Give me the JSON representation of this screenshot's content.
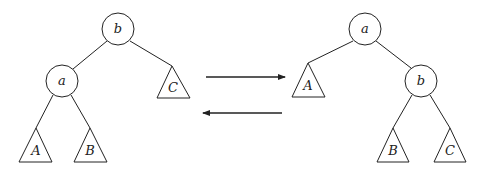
{
  "diagram": {
    "left_tree": {
      "root": "b",
      "nodes": [
        {
          "id": "b",
          "label": "b",
          "children": [
            "a",
            "C"
          ]
        },
        {
          "id": "a",
          "label": "a",
          "children": [
            "A",
            "B"
          ]
        }
      ],
      "subtrees": [
        {
          "id": "A",
          "label": "A"
        },
        {
          "id": "B",
          "label": "B"
        },
        {
          "id": "C",
          "label": "C"
        }
      ]
    },
    "right_tree": {
      "root": "a",
      "nodes": [
        {
          "id": "a",
          "label": "a",
          "children": [
            "A",
            "b"
          ]
        },
        {
          "id": "b",
          "label": "b",
          "children": [
            "B",
            "C"
          ]
        }
      ],
      "subtrees": [
        {
          "id": "A",
          "label": "A"
        },
        {
          "id": "B",
          "label": "B"
        },
        {
          "id": "C",
          "label": "C"
        }
      ]
    },
    "arrows": [
      {
        "direction": "right",
        "meaning": "left-to-right rotation"
      },
      {
        "direction": "left",
        "meaning": "right-to-left rotation"
      }
    ],
    "colors": {
      "stroke": "#222222",
      "background": "#ffffff"
    }
  }
}
